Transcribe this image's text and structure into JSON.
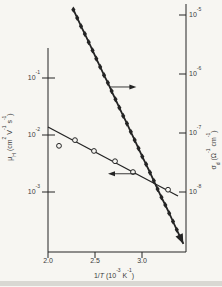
{
  "figure": {
    "background": "#f7f6f2",
    "ink": "#242424",
    "text_color": "#3a3a3a",
    "scan_band_color": "#cfcdc8"
  },
  "chart_data": {
    "type": "line",
    "title": "",
    "xlabel": "1/*T* (10^{-3} K^{-1})",
    "grid": "off",
    "legend": "none",
    "x_axis": {
      "range": [
        2.0,
        3.47
      ],
      "ticks": [
        2.0,
        2.5,
        3.0
      ],
      "tick_labels": [
        "2.0",
        "2.5",
        "3.0"
      ]
    },
    "left_axis": {
      "label": "μ_{H} (cm^{2} V^{-1} s^{-1})",
      "scale": "log",
      "tick_logs": [
        -1,
        -2,
        -3
      ],
      "tick_labels": [
        "10^{-1}",
        "10^{-2}",
        "10^{-3}"
      ]
    },
    "right_axis": {
      "label": "σ_{d} (Ω^{-1} cm^{-1})",
      "scale": "log",
      "tick_logs": [
        -5,
        -6,
        -7,
        -8
      ],
      "tick_labels": [
        "10^{-5}",
        "10^{-6}",
        "10^{-7}",
        "10^{-8}"
      ]
    },
    "series": [
      {
        "name": "dark-conductivity",
        "axis": "right",
        "marker": "filled-diamond",
        "line_width": 1.8,
        "x": [
          2.27,
          2.311,
          2.351,
          2.392,
          2.433,
          2.474,
          2.514,
          2.555,
          2.596,
          2.637,
          2.677,
          2.718,
          2.759,
          2.8,
          2.84,
          2.881,
          2.922,
          2.963,
          3.003,
          3.044,
          3.085,
          3.126,
          3.166,
          3.207,
          3.248,
          3.289,
          3.33,
          3.37
        ],
        "logy": [
          -4.91,
          -5.05,
          -5.19,
          -5.32,
          -5.46,
          -5.6,
          -5.74,
          -5.88,
          -6.02,
          -6.15,
          -6.29,
          -6.43,
          -6.57,
          -6.71,
          -6.84,
          -6.98,
          -7.12,
          -7.26,
          -7.4,
          -7.53,
          -7.67,
          -7.81,
          -7.95,
          -8.09,
          -8.22,
          -8.36,
          -8.5,
          -8.64
        ],
        "arrow_tip": {
          "x": 3.44,
          "logy": -8.88
        }
      },
      {
        "name": "hall-mobility",
        "axis": "left",
        "marker": "open-circle",
        "line_width": 1.3,
        "fit_line": {
          "x": [
            2.0,
            3.383
          ],
          "logy": [
            -1.86,
            -3.07
          ]
        },
        "x": [
          2.117,
          2.287,
          2.489,
          2.713,
          2.904,
          3.277
        ],
        "logy": [
          -2.19,
          -2.09,
          -2.28,
          -2.46,
          -2.65,
          -2.96
        ]
      }
    ],
    "axis_pointer_arrows": [
      {
        "series": "dark-conductivity",
        "points_to": "right-axis",
        "logy": -6.22,
        "x_tail": 2.66,
        "x_head": 2.94,
        "direction": "right"
      },
      {
        "series": "hall-mobility",
        "points_to": "left-axis",
        "logy": -2.68,
        "x_tail": 2.936,
        "x_head": 2.638,
        "direction": "left"
      }
    ]
  }
}
